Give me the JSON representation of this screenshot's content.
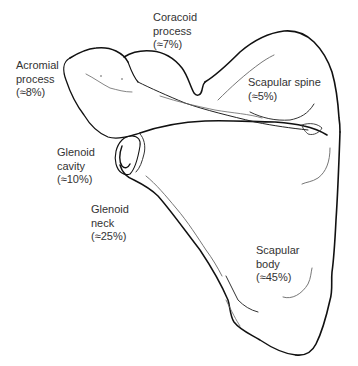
{
  "diagram": {
    "subject": "Scapula",
    "colors": {
      "background": "#ffffff",
      "outline": "#111111",
      "detail_line": "#555555",
      "text": "#333333"
    },
    "labels": [
      {
        "id": "coracoid",
        "lines": [
          "Coracoid",
          "process"
        ],
        "percent": "(≈7%)"
      },
      {
        "id": "acromial",
        "lines": [
          "Acromial",
          "process"
        ],
        "percent": "(≈8%)"
      },
      {
        "id": "scapular-spine",
        "lines": [
          "Scapular spine"
        ],
        "percent": "(≈5%)"
      },
      {
        "id": "glenoid-cavity",
        "lines": [
          "Glenoid",
          "cavity"
        ],
        "percent": "(≈10%)"
      },
      {
        "id": "glenoid-neck",
        "lines": [
          "Glenoid",
          "neck"
        ],
        "percent": "(≈25%)"
      },
      {
        "id": "scapular-body",
        "lines": [
          "Scapular",
          "body"
        ],
        "percent": "(≈45%)"
      }
    ]
  }
}
